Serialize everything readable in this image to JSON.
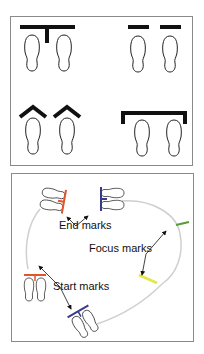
{
  "top_panel": {
    "description": "Four foot-mark styles",
    "mark_styles": [
      "T-mark",
      "Separate bar marks",
      "Chevron marks",
      "Bracket mark"
    ],
    "mark_color": "#111111"
  },
  "bottom_panel": {
    "labels": {
      "end": "End marks",
      "focus": "Focus marks",
      "start": "Start marks"
    },
    "colors": {
      "red_mark": "#e0552a",
      "blue_mark": "#3a3a8c",
      "green_mark": "#5a9a3a",
      "yellow_mark": "#e6e64a",
      "path": "#c8c8c8"
    }
  }
}
